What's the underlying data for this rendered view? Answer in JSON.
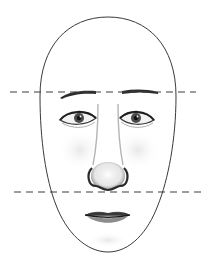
{
  "figure": {
    "title": "",
    "guide_lines": [
      {
        "name": "brow-line",
        "y": 92
      },
      {
        "name": "nose-base-line",
        "y": 192
      }
    ],
    "features": [
      "head-outline",
      "eyebrows",
      "eyes",
      "nose",
      "lips"
    ],
    "colors": {
      "outline": "#3a3a3a",
      "dash": "#3c3c3c",
      "shading": "#9a9a9a",
      "background": "#ffffff"
    },
    "caption": ""
  }
}
